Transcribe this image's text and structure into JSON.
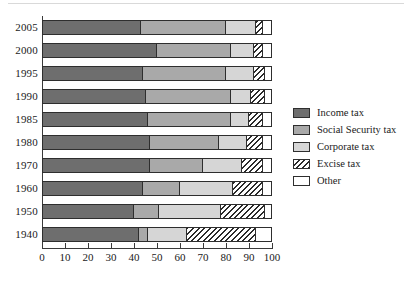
{
  "chart_data": {
    "type": "bar",
    "orientation": "horizontal",
    "stacked": true,
    "title": "",
    "subtitle": "",
    "xlabel": "",
    "ylabel": "",
    "xlim": [
      0,
      100
    ],
    "ylim": null,
    "grid": false,
    "legend_position": "right",
    "xticks": [
      0,
      10,
      20,
      30,
      40,
      50,
      60,
      70,
      80,
      90,
      100
    ],
    "xticklabels": [
      "0",
      "10",
      "20",
      "30",
      "40",
      "50",
      "60",
      "70",
      "80",
      "90",
      "100"
    ],
    "categories": [
      "2005",
      "2000",
      "1995",
      "1990",
      "1985",
      "1980",
      "1970",
      "1960",
      "1950",
      "1940"
    ],
    "series": [
      {
        "name": "Income tax",
        "color": "#6e6e6e",
        "pattern": "solid",
        "values": [
          43,
          50,
          44,
          45,
          46,
          47,
          47,
          44,
          40,
          42
        ]
      },
      {
        "name": "Social Security tax",
        "color": "#a9a9a9",
        "pattern": "solid",
        "values": [
          37,
          32,
          36,
          37,
          36,
          30,
          23,
          16,
          11,
          4
        ]
      },
      {
        "name": "Corporate tax",
        "color": "#d6d6d6",
        "pattern": "solid",
        "values": [
          13,
          10,
          12,
          9,
          8,
          12,
          17,
          23,
          27,
          17
        ]
      },
      {
        "name": "Excise tax",
        "color": "#ffffff",
        "pattern": "diagonal-hatch",
        "values": [
          3,
          4,
          5,
          6,
          6,
          7,
          9,
          13,
          19,
          30
        ]
      },
      {
        "name": "Other",
        "color": "#ffffff",
        "pattern": "solid",
        "values": [
          4,
          4,
          3,
          3,
          4,
          4,
          4,
          4,
          3,
          7
        ]
      }
    ]
  },
  "legend": {
    "items": [
      {
        "label": "Income tax"
      },
      {
        "label": "Social Security tax"
      },
      {
        "label": "Corporate tax"
      },
      {
        "label": "Excise tax"
      },
      {
        "label": "Other"
      }
    ]
  }
}
